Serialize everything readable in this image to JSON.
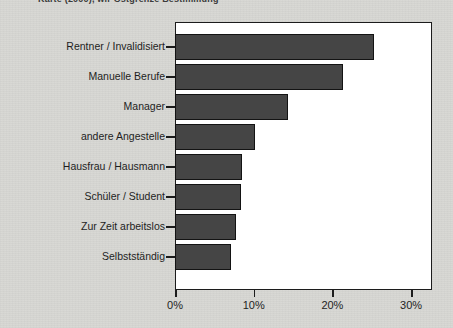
{
  "figure": {
    "caption_fragment": "Karte (2000), wir Ostgrenze Bestimmung",
    "background_color": "#d7d7d3",
    "plot_background_color": "#ffffff",
    "bar_fill_color": "#454545",
    "bar_border_color": "#131313",
    "axis_color": "#1c1c1c"
  },
  "chart_data": {
    "type": "bar",
    "orientation": "horizontal",
    "title": "",
    "xlabel": "",
    "ylabel": "",
    "xlim": [
      0,
      31.5
    ],
    "grid": false,
    "legend": null,
    "categories": [
      "Rentner /  Invalidisiert",
      "Manuelle Berufe",
      "Manager",
      "andere Angestelle",
      "Hausfrau / Hausmann",
      "Schüler / Student",
      "Zur Zeit arbeitslos",
      "Selbstständig"
    ],
    "values": [
      25.3,
      21.3,
      14.3,
      10.2,
      8.5,
      8.4,
      7.8,
      7.1
    ],
    "value_unit": "%",
    "xticks": [
      0,
      10,
      20,
      30
    ],
    "xticklabels": [
      "0%",
      "10%",
      "20%",
      "30%"
    ]
  }
}
